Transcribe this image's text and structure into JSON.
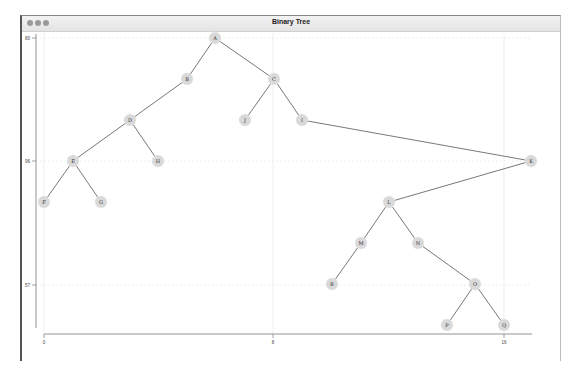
{
  "window": {
    "title": "Binary Tree",
    "controls": [
      "close",
      "minimize",
      "zoom"
    ]
  },
  "axes": {
    "x_ticks": [
      {
        "label": "0",
        "px": 44
      },
      {
        "label": "8",
        "px": 273
      },
      {
        "label": "16",
        "px": 504
      }
    ],
    "y_ticks": [
      {
        "label": "80",
        "py": 38
      },
      {
        "label": "96",
        "py": 161
      },
      {
        "label": "57",
        "py": 285
      }
    ]
  },
  "colors": {
    "node_fill": "#d9d9d9",
    "edge": "#555555",
    "grid": "#e2e2e2",
    "axis": "#666666"
  },
  "chart_data": {
    "type": "tree",
    "title": "Binary Tree",
    "nodes": [
      {
        "id": "A",
        "x": 215,
        "y": 38
      },
      {
        "id": "B",
        "x": 187,
        "y": 79
      },
      {
        "id": "C",
        "x": 274,
        "y": 79
      },
      {
        "id": "D",
        "x": 130,
        "y": 120
      },
      {
        "id": "J",
        "x": 245,
        "y": 120
      },
      {
        "id": "I",
        "x": 302,
        "y": 120
      },
      {
        "id": "E",
        "x": 73,
        "y": 161
      },
      {
        "id": "H",
        "x": 158,
        "y": 161
      },
      {
        "id": "K",
        "x": 531,
        "y": 161
      },
      {
        "id": "F",
        "x": 44,
        "y": 202
      },
      {
        "id": "G",
        "x": 101,
        "y": 202
      },
      {
        "id": "L",
        "x": 389,
        "y": 202
      },
      {
        "id": "M",
        "x": 361,
        "y": 243
      },
      {
        "id": "N",
        "x": 418,
        "y": 243
      },
      {
        "id": "R",
        "x": 332,
        "y": 284
      },
      {
        "id": "O",
        "x": 475,
        "y": 284
      },
      {
        "id": "P",
        "x": 447,
        "y": 325
      },
      {
        "id": "Q",
        "x": 504,
        "y": 325
      }
    ],
    "edges": [
      [
        "A",
        "B"
      ],
      [
        "A",
        "C"
      ],
      [
        "B",
        "D"
      ],
      [
        "C",
        "J"
      ],
      [
        "C",
        "I"
      ],
      [
        "D",
        "E"
      ],
      [
        "D",
        "H"
      ],
      [
        "E",
        "F"
      ],
      [
        "E",
        "G"
      ],
      [
        "I",
        "K"
      ],
      [
        "K",
        "L"
      ],
      [
        "L",
        "M"
      ],
      [
        "L",
        "N"
      ],
      [
        "M",
        "R"
      ],
      [
        "N",
        "O"
      ],
      [
        "O",
        "P"
      ],
      [
        "O",
        "Q"
      ]
    ],
    "xlabel": "",
    "ylabel": "",
    "x_tick_labels": [
      "0",
      "8",
      "16"
    ],
    "y_tick_labels": [
      "80",
      "96",
      "57"
    ],
    "grid": true
  }
}
